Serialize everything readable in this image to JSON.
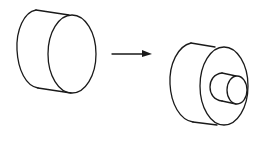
{
  "diagram": {
    "colors": {
      "line": "#1a1a1a",
      "background": "#ffffff"
    },
    "source_shape": {
      "label": "",
      "type": "cylinder"
    },
    "arrow": {
      "label": "",
      "direction": "right"
    },
    "result_shape": {
      "label": "",
      "type": "stepped-cylinder",
      "parts": [
        "large-cylinder",
        "small-boss-cylinder"
      ]
    }
  }
}
